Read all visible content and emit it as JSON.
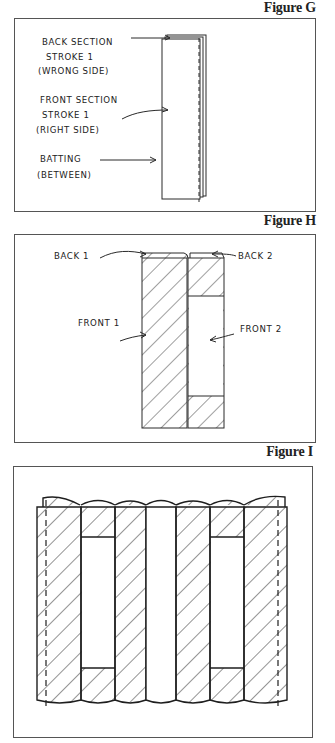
{
  "figures": [
    {
      "id": "G",
      "title": "Figure G",
      "labels": {
        "back_section_l1": "Back Section",
        "back_section_l2": "Stroke 1",
        "back_section_l3": "(Wrong Side)",
        "front_section_l1": "Front Section",
        "front_section_l2": "Stroke 1",
        "front_section_l3": "(Right Side)",
        "batting_l1": "Batting",
        "batting_l2": "(Between)"
      }
    },
    {
      "id": "H",
      "title": "Figure H",
      "labels": {
        "back1": "Back 1",
        "back2": "Back 2",
        "front1": "Front 1",
        "front2": "Front 2"
      }
    },
    {
      "id": "I",
      "title": "Figure I",
      "columns": [
        {
          "index": 1,
          "pattern": "hatched",
          "dashed_seam": true
        },
        {
          "index": 2,
          "pattern": "hatched-top-bottom-open-middle"
        },
        {
          "index": 3,
          "pattern": "hatched"
        },
        {
          "index": 4,
          "pattern": "open"
        },
        {
          "index": 5,
          "pattern": "hatched"
        },
        {
          "index": 6,
          "pattern": "hatched-top-bottom-open-middle"
        },
        {
          "index": 7,
          "pattern": "hatched",
          "dashed_seam": true
        }
      ]
    }
  ],
  "colors": {
    "line": "#2a2a2a",
    "frame": "#555555",
    "background": "#ffffff"
  }
}
